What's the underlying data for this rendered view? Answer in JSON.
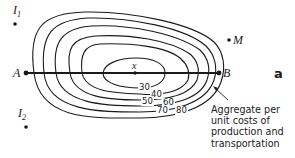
{
  "diagram": {
    "points": {
      "A": {
        "label": "A"
      },
      "B": {
        "label": "B"
      },
      "x": {
        "label": "x"
      },
      "M": {
        "label": "M"
      },
      "I1": {
        "label": "I",
        "sub": "1"
      },
      "I2": {
        "label": "I",
        "sub": "2"
      }
    },
    "panel_label": "a",
    "contour_labels": [
      "30",
      "40",
      "50",
      "60",
      "70",
      "80"
    ],
    "annotation": {
      "lines": [
        "Aggregate per",
        "unit costs of",
        "production and",
        "transportation"
      ]
    },
    "colors": {
      "ink": "#1a1a1a",
      "background": "#ffffff"
    }
  }
}
